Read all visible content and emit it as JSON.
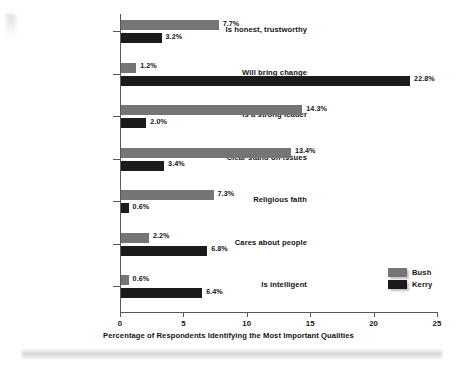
{
  "chart_data": {
    "type": "bar",
    "orientation": "horizontal",
    "title": "",
    "xlabel": "Percentage of Respondents Identifying the Most Important Qualities",
    "ylabel": "",
    "xlim": [
      0,
      25
    ],
    "xticks": [
      0,
      5,
      10,
      15,
      20,
      25
    ],
    "xtick_labels": [
      "0",
      "5",
      "10",
      "15",
      "20",
      "25"
    ],
    "grid": false,
    "legend_position": "right-bottom",
    "categories": [
      "Is honest, trustworthy",
      "Will bring change",
      "Is a strong leader",
      "Clear stand on issues",
      "Religious faith",
      "Cares about people",
      "Is intelligent"
    ],
    "series": [
      {
        "name": "Bush",
        "color": "#757577",
        "values": [
          7.7,
          1.2,
          14.3,
          13.4,
          7.3,
          2.2,
          0.6
        ],
        "value_labels": [
          "7.7%",
          "1.2%",
          "14.3%",
          "13.4%",
          "7.3%",
          "2.2%",
          "0.6%"
        ]
      },
      {
        "name": "Kerry",
        "color": "#1b1b1d",
        "values": [
          3.2,
          22.8,
          2.0,
          3.4,
          0.6,
          6.8,
          6.4
        ],
        "value_labels": [
          "3.2%",
          "22.8%",
          "2.0%",
          "3.4%",
          "0.6%",
          "6.8%",
          "6.4%"
        ]
      }
    ]
  }
}
